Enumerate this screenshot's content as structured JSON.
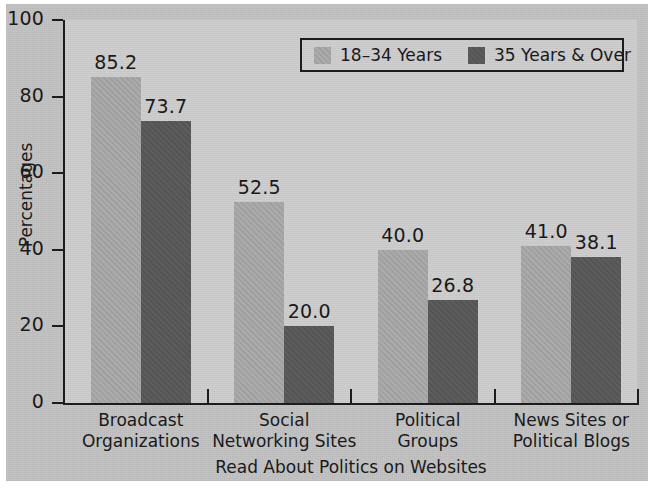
{
  "chart_data": {
    "type": "bar",
    "title": "",
    "xlabel": "Read About Politics on Websites",
    "ylabel": "Percentages",
    "ylim": [
      0,
      100
    ],
    "yticks": [
      0,
      20,
      40,
      60,
      80,
      100
    ],
    "ytick_labels": [
      "0",
      "20",
      "40",
      "60",
      "80",
      "100"
    ],
    "grid": false,
    "legend_position": "top-right",
    "categories": [
      "Broadcast Organizations",
      "Social Networking Sites",
      "Political Groups",
      "News Sites or Political Blogs"
    ],
    "category_lines": [
      [
        "Broadcast",
        "Organizations"
      ],
      [
        "Social",
        "Networking Sites"
      ],
      [
        "Political",
        "Groups"
      ],
      [
        "News Sites or",
        "Political Blogs"
      ]
    ],
    "series": [
      {
        "name": "18–34 Years",
        "color": "#a6a6a6",
        "values": [
          85.2,
          52.5,
          40.0,
          41.0
        ],
        "value_labels": [
          "85.2",
          "52.5",
          "40.0",
          "41.0"
        ]
      },
      {
        "name": "35 Years & Over",
        "color": "#575757",
        "values": [
          73.7,
          20.0,
          26.8,
          38.1
        ],
        "value_labels": [
          "73.7",
          "20.0",
          "26.8",
          "38.1"
        ]
      }
    ]
  },
  "legend": {
    "entries": [
      {
        "label": "18–34 Years",
        "swatch": "light"
      },
      {
        "label": "35 Years & Over",
        "swatch": "dark"
      }
    ]
  },
  "axes": {
    "y_label": "Percentages",
    "x_label": "Read About Politics on Websites",
    "y_tick_labels": [
      "100",
      "80",
      "60",
      "40",
      "20",
      "0"
    ]
  },
  "colors": {
    "series_light": "#a6a6a6",
    "series_dark": "#575757",
    "axis": "#1c1c1c",
    "plot_background": "#c9c9c9",
    "page_background": "#c2c2c2",
    "text": "#1a1a1a"
  }
}
